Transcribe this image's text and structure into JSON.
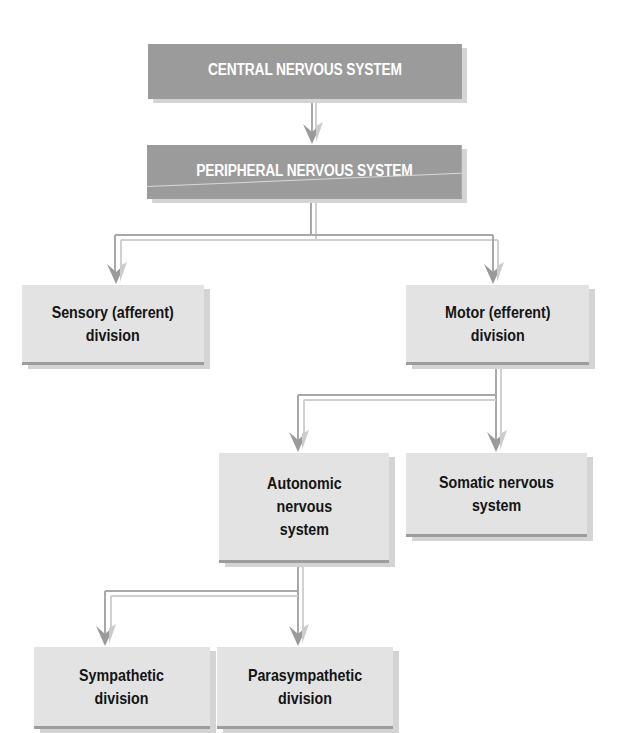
{
  "diagram": {
    "nodes": {
      "cns": {
        "label": "CENTRAL NERVOUS SYSTEM"
      },
      "pns": {
        "label": "PERIPHERAL NERVOUS SYSTEM"
      },
      "sensory": {
        "label": "Sensory (afferent)\ndivision"
      },
      "motor": {
        "label": "Motor (efferent)\ndivision"
      },
      "autonomic": {
        "label": "Autonomic\nnervous\nsystem"
      },
      "somatic": {
        "label": "Somatic nervous\nsystem"
      },
      "sympathetic": {
        "label": "Sympathetic\ndivision"
      },
      "parasympathetic": {
        "label": "Parasympathetic\ndivision"
      }
    },
    "edges": [
      {
        "from": "cns",
        "to": "pns"
      },
      {
        "from": "pns",
        "to": "sensory"
      },
      {
        "from": "pns",
        "to": "motor"
      },
      {
        "from": "motor",
        "to": "autonomic"
      },
      {
        "from": "motor",
        "to": "somatic"
      },
      {
        "from": "autonomic",
        "to": "sympathetic"
      },
      {
        "from": "autonomic",
        "to": "parasympathetic"
      }
    ],
    "colors": {
      "header_box": "#9b9b9b",
      "header_text": "#ffffff",
      "box": "#e3e3e3",
      "box_text": "#141414",
      "connector": "#a8a8a8",
      "connector_highlight": "#cfcfcf",
      "arrow": "#9a9a9a",
      "arrow_light": "#cccccc"
    }
  }
}
